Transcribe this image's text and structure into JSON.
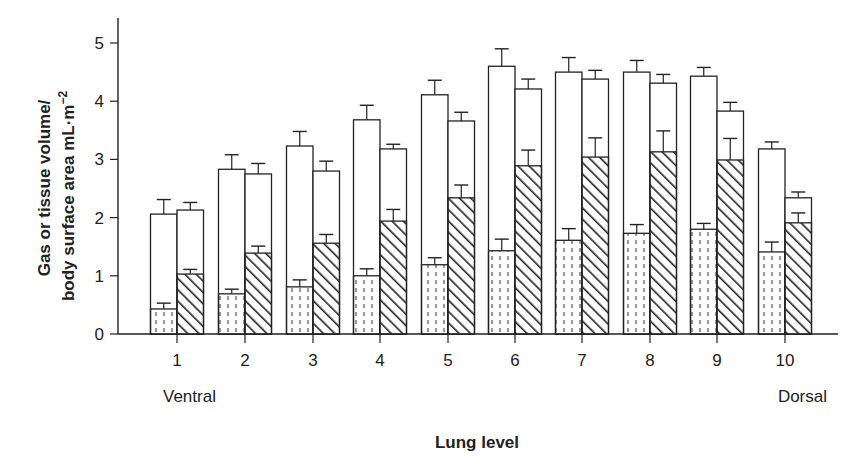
{
  "chart_data": {
    "type": "bar",
    "title": "",
    "xlabel": "Lung level",
    "ylabel": "Gas or tissue volume/ body surface area mL·m⁻²",
    "ylabel_line1": "Gas or tissue volume/",
    "ylabel_line2": "body surface area mL·m",
    "ylabel_sup": "−2",
    "ylim": [
      0,
      5
    ],
    "yticks": [
      "0",
      "1",
      "2",
      "3",
      "4",
      "5"
    ],
    "categories": [
      "1",
      "2",
      "3",
      "4",
      "5",
      "6",
      "7",
      "8",
      "9",
      "10"
    ],
    "x_annotations": {
      "left": "Ventral",
      "right": "Dorsal"
    },
    "grid": false,
    "legend": null,
    "series": [
      {
        "name": "Left bar total (open)",
        "values": [
          2.06,
          2.83,
          3.23,
          3.68,
          4.11,
          4.6,
          4.5,
          4.5,
          4.43,
          3.18
        ],
        "errors": [
          0.25,
          0.25,
          0.25,
          0.25,
          0.25,
          0.3,
          0.25,
          0.2,
          0.15,
          0.12
        ]
      },
      {
        "name": "Left bar lower segment (dotted)",
        "values": [
          0.43,
          0.69,
          0.81,
          1.0,
          1.19,
          1.43,
          1.61,
          1.73,
          1.8,
          1.41
        ],
        "errors": [
          0.1,
          0.08,
          0.12,
          0.12,
          0.12,
          0.2,
          0.2,
          0.15,
          0.1,
          0.17
        ]
      },
      {
        "name": "Right bar total (open)",
        "values": [
          2.13,
          2.75,
          2.8,
          3.18,
          3.66,
          4.21,
          4.38,
          4.31,
          3.83,
          2.34
        ],
        "errors": [
          0.13,
          0.18,
          0.17,
          0.08,
          0.15,
          0.17,
          0.15,
          0.15,
          0.15,
          0.1
        ]
      },
      {
        "name": "Right bar lower segment (hatched)",
        "values": [
          1.03,
          1.39,
          1.56,
          1.94,
          2.34,
          2.89,
          3.04,
          3.13,
          2.99,
          1.91
        ],
        "errors": [
          0.08,
          0.12,
          0.15,
          0.2,
          0.22,
          0.27,
          0.33,
          0.36,
          0.37,
          0.17
        ]
      }
    ]
  }
}
